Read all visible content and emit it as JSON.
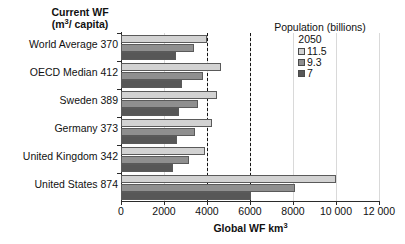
{
  "header": {
    "y_axis_title_line1": "Current WF",
    "y_axis_title_line2_pre": "(m",
    "y_axis_title_line2_sup": "3",
    "y_axis_title_line2_post": "/ capita)"
  },
  "legend": {
    "title": "Population (billions)",
    "year": "2050",
    "entries": [
      {
        "label": "11.5",
        "color": "#d2d2d2"
      },
      {
        "label": "9.3",
        "color": "#8f8f8f"
      },
      {
        "label": "7",
        "color": "#575757"
      }
    ]
  },
  "axis": {
    "x_title_pre": "Global WF km",
    "x_title_sup": "3",
    "x_ticks": [
      "0",
      "2000",
      "4000",
      "6000",
      "8000",
      "10 000",
      "12 000"
    ],
    "x_tick_values": [
      0,
      2000,
      4000,
      6000,
      8000,
      10000,
      12000
    ],
    "reference_lines": [
      4000,
      6000
    ]
  },
  "chart_data": {
    "type": "bar",
    "orientation": "horizontal",
    "title": "",
    "xlabel": "Global WF km3",
    "ylabel": "Current WF (m3/ capita)",
    "xlim": [
      0,
      12000
    ],
    "grid": true,
    "legend_position": "top-right",
    "legend_title": "Population (billions) 2050",
    "categories": [
      "World Average 370",
      "OECD Median 412",
      "Sweden 389",
      "Germany 373",
      "United Kingdom 342",
      "United States 874"
    ],
    "category_current_wf": [
      370,
      412,
      389,
      373,
      342,
      874
    ],
    "series": [
      {
        "name": "11.5",
        "color": "#d2d2d2",
        "values": [
          4000,
          4650,
          4450,
          4250,
          3900,
          10000
        ]
      },
      {
        "name": "9.3",
        "color": "#8f8f8f",
        "values": [
          3400,
          3800,
          3600,
          3450,
          3150,
          8100
        ]
      },
      {
        "name": "7",
        "color": "#575757",
        "values": [
          2550,
          2850,
          2700,
          2600,
          2400,
          6050
        ]
      }
    ],
    "reference_lines": [
      4000,
      6000
    ],
    "annotations": []
  }
}
